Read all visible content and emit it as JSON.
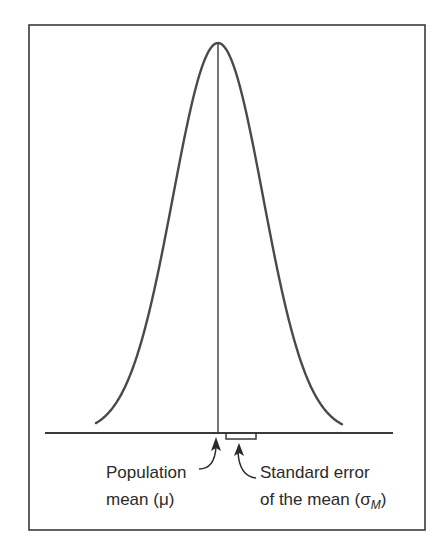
{
  "figure": {
    "frame": {
      "x": 29,
      "y": 25,
      "width": 396,
      "height": 505
    },
    "stroke_color": "#3a3a3a",
    "curve": {
      "type": "normal-distribution",
      "mean_x": 218,
      "peak_y": 43,
      "base_y": 433,
      "sigma_px": 45,
      "x_start": 96,
      "x_end": 342
    },
    "baseline": {
      "x1": 45,
      "x2": 393,
      "y": 433
    },
    "mean_line": {
      "x": 218,
      "y1": 43,
      "y2": 433
    },
    "se_bracket": {
      "x1": 226,
      "x2": 256,
      "y_top": 433,
      "y_bottom": 439
    },
    "labels": {
      "population_line1": "Population",
      "population_line2": "mean (μ)",
      "se_line1": "Standard error",
      "se_line2_prefix": "of the mean (σ",
      "se_line2_subscript": "M",
      "se_line2_suffix": ")"
    }
  },
  "chart_data": {
    "type": "line",
    "title": "",
    "xlabel": "",
    "ylabel": "",
    "annotations": [
      {
        "text": "Population mean (μ)",
        "target": "center of distribution"
      },
      {
        "text": "Standard error of the mean (σM)",
        "target": "bracket from mean to +1 SE"
      }
    ],
    "grid": false,
    "legend": null
  }
}
